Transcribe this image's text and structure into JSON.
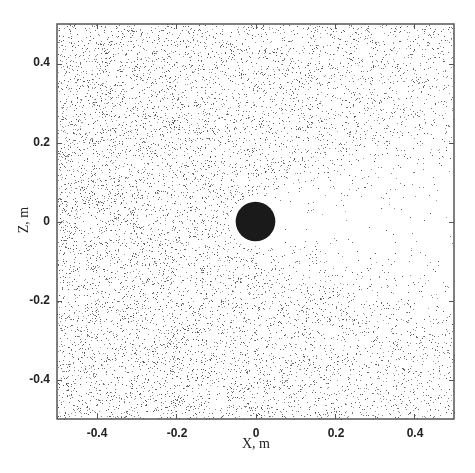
{
  "chart_data": {
    "type": "scatter",
    "title": "",
    "xlabel": "X, m",
    "ylabel": "Z, m",
    "xlim": [
      -0.5,
      0.5
    ],
    "ylim": [
      -0.5,
      0.5
    ],
    "x_ticks": [
      -0.4,
      -0.2,
      0,
      0.2,
      0.4
    ],
    "y_ticks": [
      -0.4,
      -0.2,
      0,
      0.2,
      0.4
    ],
    "x_tick_labels": [
      "-0.4",
      "-0.2",
      "0",
      "0.2",
      "0.4"
    ],
    "y_tick_labels": [
      "0.4",
      "0.2",
      "0",
      "-0.2",
      "-0.4"
    ],
    "grid": false,
    "legend": null,
    "series": [
      {
        "name": "particles",
        "kind": "random scatter field",
        "approx_count": 9000,
        "color": "#444444",
        "marker_size_px": 1,
        "distribution": "roughly uniform, denser on left/bottom, depleted wedge (shadow) to the right of the obstacle"
      }
    ],
    "annotations": [
      {
        "kind": "filled-circle",
        "label": "obstacle",
        "center": [
          0,
          0
        ],
        "radius": 0.05,
        "color": "#1a1a1a"
      }
    ]
  },
  "layout": {
    "plot_left_px": 57,
    "plot_top_px": 24,
    "plot_right_px": 454,
    "plot_bottom_px": 419,
    "frame_color": "#555555",
    "seed": 12345
  }
}
